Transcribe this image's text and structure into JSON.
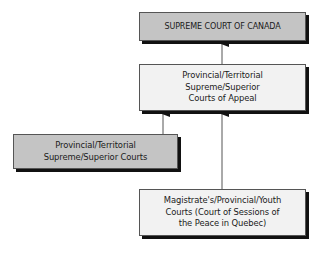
{
  "diagram": {
    "type": "hierarchy",
    "title": "",
    "nodes": [
      {
        "id": "scc",
        "label": "SUPREME COURT OF CANADA",
        "style": "dark"
      },
      {
        "id": "appeal",
        "label": "Provincial/Territorial\nSupreme/Superior\nCourts of Appeal",
        "style": "light"
      },
      {
        "id": "superior",
        "label": "Provincial/Territorial\nSupreme/Superior Courts",
        "style": "dark"
      },
      {
        "id": "magistrate",
        "label": "Magistrate's/Provincial/Youth\nCourts (Court of Sessions of\nthe Peace in Quebec)",
        "style": "light"
      }
    ],
    "edges": [
      {
        "from": "appeal",
        "to": "scc"
      },
      {
        "from": "superior",
        "to": "appeal"
      },
      {
        "from": "magistrate",
        "to": "appeal"
      }
    ],
    "colors": {
      "dark_fill": "#c4c4c4",
      "light_fill": "#f2f2f2",
      "border": "#555555",
      "shadow": "#111111",
      "connector": "#555555",
      "arrowhead": "#111111"
    }
  }
}
